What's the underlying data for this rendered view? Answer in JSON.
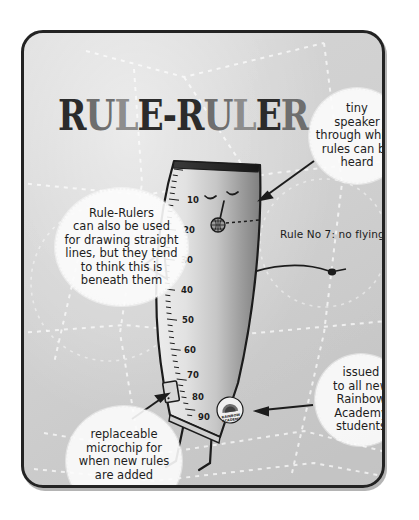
{
  "page": {
    "background_color": "#ffffff",
    "panel": {
      "border_color": "#232323",
      "fill_color": "#d2d2d2"
    }
  },
  "title": {
    "full_text": "RULE-RULER",
    "letters": [
      {
        "ch": "R",
        "shade": "dark"
      },
      {
        "ch": "U",
        "shade": "mid"
      },
      {
        "ch": "L",
        "shade": "light"
      },
      {
        "ch": "E",
        "shade": "dark"
      },
      {
        "ch": "-",
        "shade": "dark"
      },
      {
        "ch": "R",
        "shade": "dark"
      },
      {
        "ch": "U",
        "shade": "mid"
      },
      {
        "ch": "L",
        "shade": "light"
      },
      {
        "ch": "E",
        "shade": "dark"
      },
      {
        "ch": "R",
        "shade": "mid"
      }
    ],
    "colors": {
      "dark": "#2b2b2b",
      "mid": "#6e6e6e",
      "light": "#8d8d8d"
    }
  },
  "callouts": [
    {
      "id": "speaker",
      "lines": [
        "tiny",
        "speaker",
        "through which",
        "rules can be",
        "heard"
      ],
      "sub": ""
    },
    {
      "id": "straight-lines",
      "lines": [
        "Rule-Rulers",
        "can also be used",
        "for drawing straight",
        "lines, but they tend",
        "to think this is",
        "beneath them"
      ],
      "sub": ""
    },
    {
      "id": "microchip",
      "lines": [
        "replaceable",
        "microchip for",
        "when new rules",
        "are added"
      ],
      "sub": "(once a week)"
    },
    {
      "id": "issued",
      "lines": [
        "issued",
        "to all new",
        "Rainbow",
        "Academy",
        "students"
      ],
      "sub": ""
    }
  ],
  "speech": {
    "rule_caption": "Rule No 7: no flying indoors"
  },
  "ruler": {
    "scale_numbers": [
      "10",
      "20",
      "30",
      "40",
      "50",
      "60",
      "70",
      "80",
      "90"
    ],
    "badge_text_top": "RAINBOW",
    "badge_text_bottom": "ACADEMY",
    "body_fill_light": "#e4e4e4",
    "body_fill_dark": "#8e8e8e",
    "outline_color": "#1c1c1c"
  }
}
